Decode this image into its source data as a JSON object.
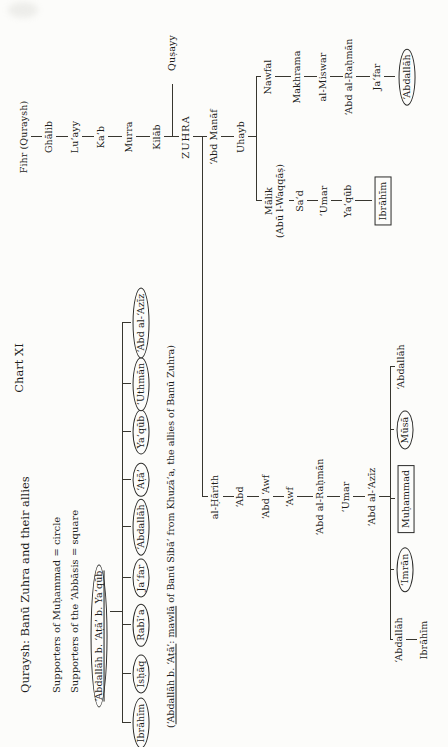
{
  "page": {
    "chart_label": "Chart XI",
    "title": "Quraysh: Banū Zuhra and their allies",
    "legend_circle": "Supporters of Muḥammad = circle",
    "legend_square": "Supporters of the ‘Abbāsis = square",
    "footnote_parts": [
      {
        "text": "(",
        "underline": false
      },
      {
        "text": "‘Abdallāh b. ‘Aṭā’",
        "underline": true
      },
      {
        "text": ": ",
        "underline": false
      },
      {
        "text": "mawlā",
        "underline": true
      },
      {
        "text": " of Banū Sibā‘ from Khuzā‘a, the allies of Banū Zuhra)",
        "underline": false
      }
    ]
  },
  "chart_data": {
    "type": "genealogy-tree",
    "orientation": "landscape chart printed sideways on portrait page, rotated 90° counterclockwise",
    "canvas": {
      "width": 747,
      "height": 448
    },
    "marks": {
      "oval": "supporter of Muḥammad (circle)",
      "box": "supporter of the ‘Abbāsis (square)"
    },
    "nodes": [
      {
        "id": "fihr-quraysh",
        "label": "Fihr (Quraysh)",
        "x": 610,
        "y": 24
      },
      {
        "id": "ghalib",
        "label": "Ghālib",
        "x": 610,
        "y": 49
      },
      {
        "id": "luayy",
        "label": "Lu’ayy",
        "x": 610,
        "y": 75
      },
      {
        "id": "kab",
        "label": "Ka‘b",
        "x": 610,
        "y": 101
      },
      {
        "id": "murra",
        "label": "Murra",
        "x": 610,
        "y": 129
      },
      {
        "id": "kilab",
        "label": "Kilāb",
        "x": 610,
        "y": 157
      },
      {
        "id": "zuhra",
        "label": "ZUHRA",
        "x": 610,
        "y": 186,
        "caps": true
      },
      {
        "id": "abd-manaf",
        "label": "‘Abd Manāf",
        "x": 610,
        "y": 214
      },
      {
        "id": "uhayb",
        "label": "Uhayb",
        "x": 610,
        "y": 241
      },
      {
        "id": "qusayy",
        "label": "Quṣayy",
        "x": 694,
        "y": 172
      },
      {
        "id": "malik-abu-l-waqqas",
        "label": "Mālik",
        "label2": "(Abū l-Waqqāṣ)",
        "x": 546,
        "y": 275
      },
      {
        "id": "sad",
        "label": "Sa‘d",
        "x": 546,
        "y": 300
      },
      {
        "id": "umar-b-sad",
        "label": "‘Umar",
        "x": 546,
        "y": 324
      },
      {
        "id": "yaqub-b-umar",
        "label": "Ya‘qūb",
        "x": 546,
        "y": 348
      },
      {
        "id": "ibrahim-b-yaqub",
        "label": "Ibrāhīm",
        "x": 546,
        "y": 383,
        "shape": "box"
      },
      {
        "id": "nawfal",
        "label": "Nawfal",
        "x": 670,
        "y": 268
      },
      {
        "id": "makhrama",
        "label": "Makhrama",
        "x": 670,
        "y": 297
      },
      {
        "id": "al-miswar",
        "label": "al-Miswar",
        "x": 670,
        "y": 323
      },
      {
        "id": "abd-al-rahman-b-al-miswar",
        "label": "‘Abd al-Raḥmān",
        "x": 670,
        "y": 349
      },
      {
        "id": "jafar-b-abd-al-rahman",
        "label": "Ja‘far",
        "x": 670,
        "y": 377
      },
      {
        "id": "abdallah-b-jafar",
        "label": "‘Abdallāh",
        "x": 670,
        "y": 407,
        "shape": "oval"
      },
      {
        "id": "al-harith",
        "label": "al-Ḥārith",
        "x": 250,
        "y": 215
      },
      {
        "id": "abd",
        "label": "‘Abd",
        "x": 250,
        "y": 240
      },
      {
        "id": "abd-awf",
        "label": "‘Abd ‘Awf",
        "x": 250,
        "y": 266
      },
      {
        "id": "awf",
        "label": "‘Awf",
        "x": 250,
        "y": 290
      },
      {
        "id": "abd-al-rahman-b-awf",
        "label": "‘Abd al-Raḥmān",
        "x": 250,
        "y": 320
      },
      {
        "id": "umar-b-abd-al-rahman",
        "label": "‘Umar",
        "x": 250,
        "y": 346
      },
      {
        "id": "abd-al-aziz-b-umar",
        "label": "‘Abd al-‘Azīz",
        "x": 250,
        "y": 372
      },
      {
        "id": "abdallah-1-b-abd-al-aziz",
        "label": "‘Abdallāh",
        "x": 380,
        "y": 401
      },
      {
        "id": "musa",
        "label": "Mūsā",
        "x": 317,
        "y": 405,
        "shape": "oval"
      },
      {
        "id": "muhammad",
        "label": "Muḥammad",
        "x": 248,
        "y": 406,
        "shape": "box"
      },
      {
        "id": "imran",
        "label": "‘Imrān",
        "x": 177,
        "y": 405,
        "shape": "oval"
      },
      {
        "id": "abdallah-2-b-abd-al-aziz",
        "label": "‘Abdallāh",
        "x": 107,
        "y": 399
      },
      {
        "id": "ibrahim-b-abdallah",
        "label": "Ibrāhīm",
        "x": 107,
        "y": 424
      },
      {
        "id": "abdallah-b-ata-b-yaqub",
        "label": "‘Abdallāh b. ‘Aṭā’ b. Ya‘qūb",
        "x": 111,
        "y": 99,
        "shape": "oval",
        "underline": true
      },
      {
        "id": "ibrahim-b-abdallah-b-ata",
        "label": "Ibrāhīm",
        "x": 24,
        "y": 141,
        "shape": "oval"
      },
      {
        "id": "ishaq",
        "label": "Isḥāq",
        "x": 73,
        "y": 141,
        "shape": "oval"
      },
      {
        "id": "rabia",
        "label": "Rabī‘a",
        "x": 122,
        "y": 141,
        "shape": "oval"
      },
      {
        "id": "jafar-b-abdallah-b-ata",
        "label": "Ja‘far",
        "x": 169,
        "y": 141,
        "shape": "oval"
      },
      {
        "id": "abdallah-b-abdallah-b-ata",
        "label": "‘Abdallāh",
        "x": 220,
        "y": 141,
        "shape": "oval"
      },
      {
        "id": "ata",
        "label": "‘Aṭā’",
        "x": 267,
        "y": 141,
        "shape": "oval"
      },
      {
        "id": "yaqub-b-abdallah-b-ata",
        "label": "Ya‘qūb",
        "x": 315,
        "y": 141,
        "shape": "oval"
      },
      {
        "id": "uthman",
        "label": "‘Uthmān",
        "x": 363,
        "y": 141,
        "shape": "oval"
      },
      {
        "id": "abd-al-aziz-b-abdallah-b-ata",
        "label": "‘Abd al-‘Azīz",
        "x": 424,
        "y": 141,
        "shape": "oval"
      }
    ],
    "edges": [
      [
        610,
        31,
        610,
        42
      ],
      [
        610,
        56,
        610,
        68
      ],
      [
        610,
        82,
        610,
        94
      ],
      [
        610,
        108,
        610,
        122
      ],
      [
        610,
        136,
        610,
        150
      ],
      [
        610,
        164,
        610,
        179
      ],
      [
        610,
        193,
        610,
        207
      ],
      [
        610,
        221,
        610,
        234
      ],
      [
        610,
        248,
        610,
        256
      ],
      [
        610,
        172,
        663,
        172
      ],
      [
        546,
        256,
        670,
        256
      ],
      [
        546,
        256,
        546,
        262
      ],
      [
        670,
        256,
        670,
        261
      ],
      [
        546,
        289,
        546,
        294
      ],
      [
        546,
        307,
        546,
        318
      ],
      [
        546,
        331,
        546,
        342
      ],
      [
        546,
        355,
        546,
        372
      ],
      [
        670,
        275,
        670,
        291
      ],
      [
        670,
        304,
        670,
        317
      ],
      [
        670,
        330,
        670,
        343
      ],
      [
        670,
        356,
        670,
        370
      ],
      [
        670,
        384,
        670,
        395
      ],
      [
        250,
        202,
        610,
        202
      ],
      [
        250,
        202,
        250,
        208
      ],
      [
        250,
        223,
        250,
        234
      ],
      [
        250,
        247,
        250,
        259
      ],
      [
        250,
        273,
        250,
        284
      ],
      [
        250,
        297,
        250,
        313
      ],
      [
        250,
        327,
        250,
        340
      ],
      [
        250,
        353,
        250,
        365
      ],
      [
        250,
        379,
        250,
        390
      ],
      [
        107,
        390,
        380,
        390
      ],
      [
        380,
        390,
        380,
        395
      ],
      [
        317,
        390,
        317,
        394
      ],
      [
        248,
        390,
        248,
        395
      ],
      [
        177,
        390,
        177,
        394
      ],
      [
        107,
        390,
        107,
        393
      ],
      [
        107,
        406,
        107,
        417
      ],
      [
        135,
        110,
        135,
        122
      ],
      [
        24,
        122,
        424,
        122
      ],
      [
        24,
        122,
        24,
        131
      ],
      [
        73,
        122,
        73,
        131
      ],
      [
        122,
        122,
        122,
        131
      ],
      [
        169,
        122,
        169,
        131
      ],
      [
        220,
        122,
        220,
        131
      ],
      [
        267,
        122,
        267,
        131
      ],
      [
        315,
        122,
        315,
        131
      ],
      [
        363,
        122,
        363,
        131
      ],
      [
        424,
        122,
        424,
        131
      ]
    ]
  }
}
